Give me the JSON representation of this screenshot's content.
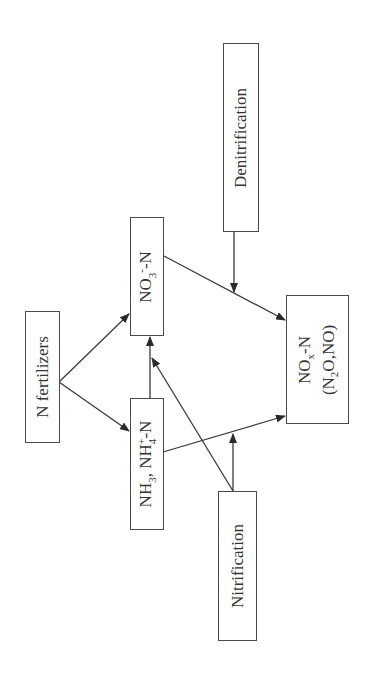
{
  "diagram": {
    "orientation": "rotated 90 degrees counter-clockwise",
    "nodes": {
      "n_fertilizers": {
        "label": "N fertilizers"
      },
      "nitrate": {
        "label_main": "NO",
        "sub": "3",
        "sup": "-",
        "suffix": "-N",
        "full": "NO3--N"
      },
      "ammonia": {
        "part1": "NH",
        "sub1": "3",
        "mid": ", NH",
        "sub2": "4",
        "sup2": "+",
        "suffix": "-N",
        "full": "NH3, NH4+-N"
      },
      "nox": {
        "line1_main": "NO",
        "line1_sub": "x",
        "line1_suffix": "-N",
        "line2_pre": "(N",
        "line2_sub": "2",
        "line2_post": "O,NO)",
        "full": "NOx-N (N2O,NO)"
      },
      "denitrification": {
        "label": "Denitrification"
      },
      "nitrification": {
        "label": "Nitrification"
      }
    },
    "edges": [
      {
        "from": "N fertilizers",
        "to": "NO3--N"
      },
      {
        "from": "N fertilizers",
        "to": "NH3, NH4+-N"
      },
      {
        "from": "NH3, NH4+-N",
        "to": "NO3--N"
      },
      {
        "from": "Nitrification",
        "to": "NO3--N pathway"
      },
      {
        "from": "Nitrification",
        "to": "NH3, NH4+-N → NOx-N pathway"
      },
      {
        "from": "NH3, NH4+-N",
        "to": "NOx-N (N2O,NO)"
      },
      {
        "from": "NO3--N",
        "to": "NOx-N (N2O,NO)"
      },
      {
        "from": "Denitrification",
        "to": "NO3--N → NOx-N pathway"
      }
    ],
    "colors": {
      "stroke": "#3a3a3a",
      "text": "#333333",
      "background": "#ffffff"
    }
  }
}
